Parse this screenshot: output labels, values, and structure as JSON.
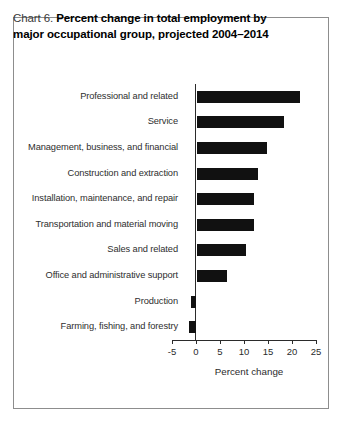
{
  "figure": {
    "title_label": "Chart 6.",
    "title_line1": "Percent change in total employment by",
    "title_line2": "major occupational group, projected 2004–2014"
  },
  "chart_data": {
    "type": "bar",
    "orientation": "horizontal",
    "title": "Chart 6. Percent change in total employment by major occupational group, projected 2004–2014",
    "xlabel": "Percent change",
    "ylabel": "",
    "xlim": [
      -5,
      25
    ],
    "xticks": [
      -5,
      0,
      5,
      10,
      15,
      20,
      25
    ],
    "xticklabels": [
      "-5",
      "0",
      "5",
      "10",
      "15",
      "20",
      "25"
    ],
    "grid": false,
    "legend": false,
    "bar_color": "#111111",
    "categories": [
      "Professional and related",
      "Service",
      "Management, business, and financial",
      "Construction and extraction",
      "Installation, maintenance, and repair",
      "Transportation and material moving",
      "Sales and related",
      "Office and administrative support",
      "Production",
      "Farming, fishing, and forestry"
    ],
    "values": [
      21.5,
      18.1,
      14.6,
      12.7,
      11.9,
      11.8,
      10.2,
      6.2,
      -1.0,
      -1.5
    ]
  }
}
